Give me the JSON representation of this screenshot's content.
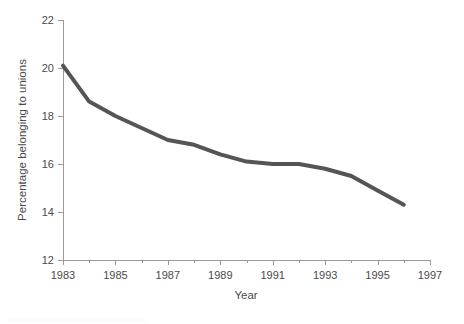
{
  "chart_data": {
    "type": "line",
    "title": "",
    "xlabel": "Year",
    "ylabel": "Percentage belonging to unions",
    "xlim": [
      1983,
      1997
    ],
    "ylim": [
      12,
      22
    ],
    "grid": false,
    "legend": null,
    "x_major_ticks": [
      1983,
      1985,
      1987,
      1989,
      1991,
      1993,
      1995,
      1997
    ],
    "x_minor_ticks": [
      1984,
      1986,
      1988,
      1990,
      1992,
      1994,
      1996
    ],
    "x_tick_labels": [
      "1983",
      "1985",
      "1987",
      "1989",
      "1991",
      "1993",
      "1995",
      "1997"
    ],
    "y_ticks": [
      12,
      14,
      16,
      18,
      20,
      22
    ],
    "y_tick_labels": [
      "12",
      "14",
      "16",
      "18",
      "20",
      "22"
    ],
    "series": [
      {
        "name": "Percentage belonging to unions",
        "color": "#555555",
        "line_width": 4,
        "x": [
          1983,
          1984,
          1985,
          1986,
          1987,
          1988,
          1989,
          1990,
          1991,
          1992,
          1993,
          1994,
          1995,
          1996
        ],
        "values": [
          20.1,
          18.6,
          18.0,
          17.5,
          17.0,
          16.8,
          16.4,
          16.1,
          16.0,
          16.0,
          15.8,
          15.5,
          14.9,
          14.3
        ]
      }
    ]
  },
  "axes": {
    "y_title": "Percentage belonging to unions",
    "x_title": "Year"
  }
}
